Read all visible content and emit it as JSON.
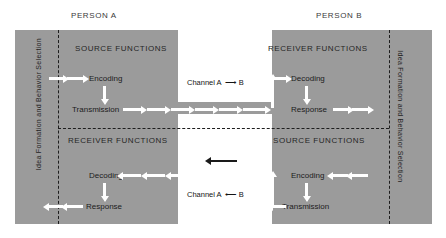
{
  "header": {
    "person_a": "PERSON A",
    "person_b": "PERSON B"
  },
  "side_labels": {
    "left": "Idea Formation and Behavior Selection",
    "right": "Idea Formation and Behavior Selection"
  },
  "quadrants": {
    "top_left": {
      "title": "SOURCE FUNCTIONS",
      "steps": [
        "Encoding",
        "Transmission"
      ]
    },
    "top_right": {
      "title": "RECEIVER FUNCTIONS",
      "steps": [
        "Decoding",
        "Response"
      ]
    },
    "bottom_left": {
      "title": "RECEIVER FUNCTIONS",
      "steps": [
        "Decoding",
        "Response"
      ]
    },
    "bottom_right": {
      "title": "SOURCE FUNCTIONS",
      "steps": [
        "Encoding",
        "Transmission"
      ]
    }
  },
  "channels": {
    "top": {
      "label_before": "Channel  A",
      "arrow": "⟶",
      "label_after": "B"
    },
    "bottom": {
      "label_before": "Channel  A",
      "arrow": "⟵",
      "label_after": "B"
    }
  },
  "colors": {
    "panel": "#9b9b9b",
    "gap": "#ffffff",
    "arrow": "#ffffff",
    "dark_line": "#1d1d1d",
    "text": "#1c1c1c"
  }
}
